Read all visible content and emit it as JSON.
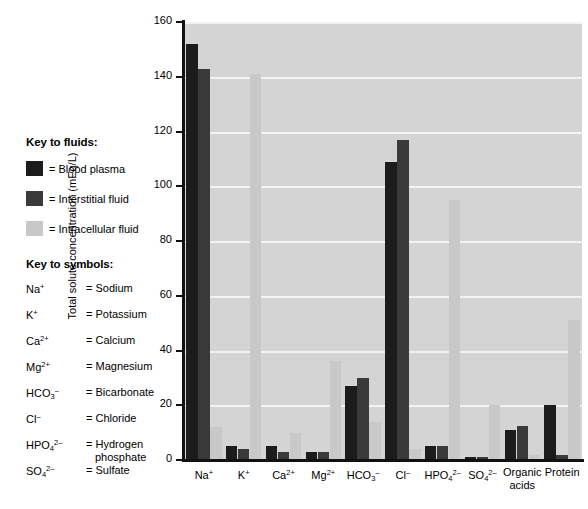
{
  "key_fluids": {
    "heading": "Key to fluids:",
    "items": [
      {
        "label": "= Blood plasma",
        "color": "#1c1c1c",
        "series": "Blood plasma"
      },
      {
        "label": "= Interstitial fluid",
        "color": "#3a3a3a",
        "series": "Interstitial fluid"
      },
      {
        "label": "= Intracellular fluid",
        "color": "#c8c8c8",
        "series": "Intracellular fluid"
      }
    ]
  },
  "key_symbols": {
    "heading": "Key to symbols:",
    "items": [
      {
        "formula_html": "Na<sup>+</sup>",
        "name": "= Sodium",
        "name2": ""
      },
      {
        "formula_html": "K<sup>+</sup>",
        "name": "= Potassium",
        "name2": ""
      },
      {
        "formula_html": "Ca<sup>2+</sup>",
        "name": "= Calcium",
        "name2": ""
      },
      {
        "formula_html": "Mg<sup>2+</sup>",
        "name": "= Magnesium",
        "name2": ""
      },
      {
        "formula_html": "HCO<sub>3</sub><sup>–</sup>",
        "name": "= Bicarbonate",
        "name2": ""
      },
      {
        "formula_html": "Cl<sup>–</sup>",
        "name": "= Chloride",
        "name2": ""
      },
      {
        "formula_html": "HPO<sub>4</sub><sup>2–</sup>",
        "name": "= Hydrogen",
        "name2": "phosphate"
      },
      {
        "formula_html": "SO<sub>4</sub><sup>2–</sup>",
        "name": "= Sulfate",
        "name2": ""
      }
    ]
  },
  "chart_data": {
    "type": "bar",
    "title": "",
    "xlabel": "",
    "ylabel": "Total solute concentration (mEq/L)",
    "ylim": [
      0,
      160
    ],
    "yticks": [
      0,
      20,
      40,
      60,
      80,
      100,
      120,
      140,
      160
    ],
    "grid": true,
    "legend_position": "left-panel",
    "plot_background": "#d4d4d4",
    "categories": [
      "Na+",
      "K+",
      "Ca2+",
      "Mg2+",
      "HCO3-",
      "Cl-",
      "HPO4 2-",
      "SO4 2-",
      "Organic acids",
      "Protein"
    ],
    "category_labels_html": [
      "Na<sup>+</sup>",
      "K<sup>+</sup>",
      "Ca<sup>2+</sup>",
      "Mg<sup>2+</sup>",
      "HCO<sub>3</sub><sup>–</sup>",
      "Cl<sup>–</sup>",
      "HPO<sub>4</sub><sup>2–</sup>",
      "SO<sub>4</sub><sup>2–</sup>",
      "Organic<br>acids",
      "Protein"
    ],
    "series": [
      {
        "name": "Blood plasma",
        "color": "#1c1c1c",
        "values": [
          152,
          5,
          5,
          3,
          27,
          109,
          5,
          1,
          11,
          20
        ]
      },
      {
        "name": "Interstitial fluid",
        "color": "#3a3a3a",
        "values": [
          143,
          4,
          3,
          3,
          30,
          117,
          5,
          1,
          12.5,
          2
        ]
      },
      {
        "name": "Intracellular fluid",
        "color": "#c8c8c8",
        "values": [
          12,
          141,
          10,
          36,
          14,
          4,
          95,
          20,
          2,
          51
        ]
      }
    ]
  }
}
